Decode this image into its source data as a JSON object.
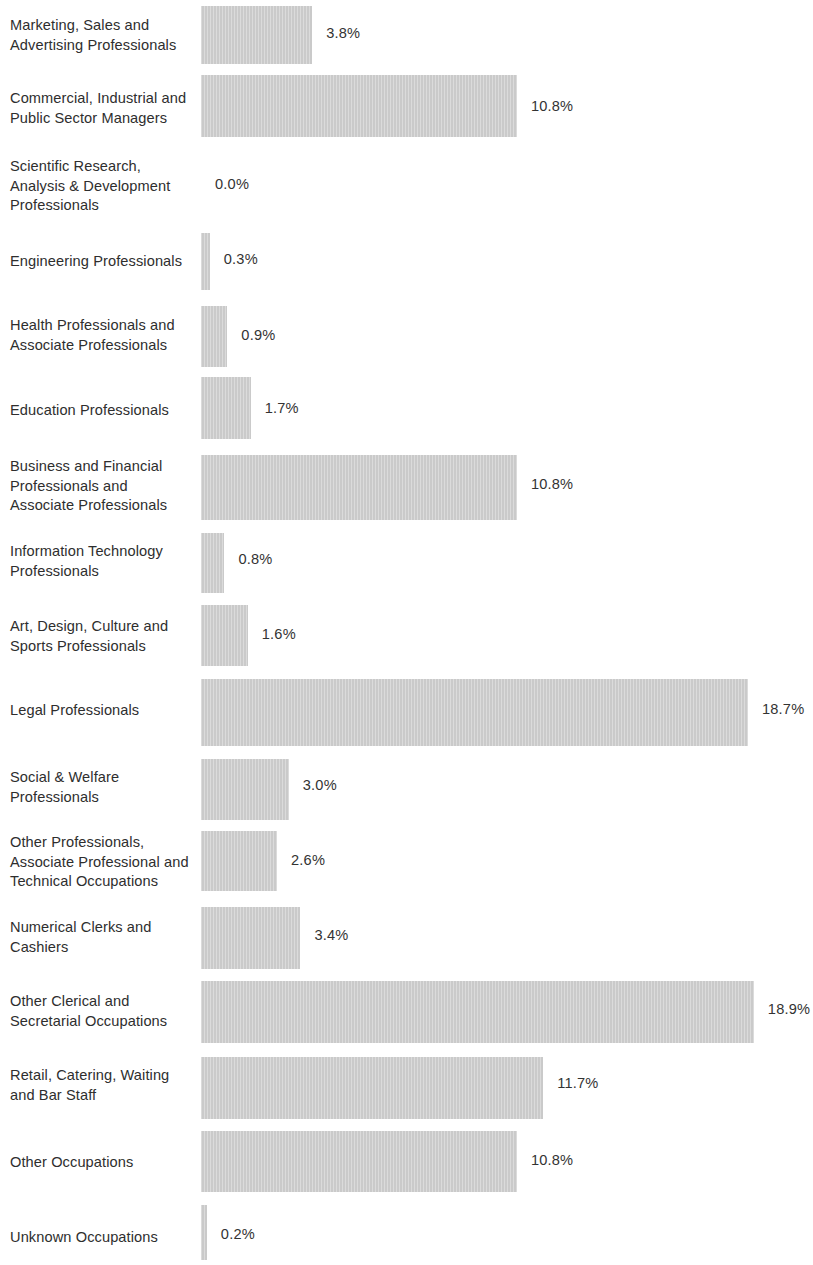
{
  "chart_data": {
    "type": "bar",
    "orientation": "horizontal",
    "title": "",
    "subtitle": "",
    "xlabel": "",
    "ylabel": "",
    "xlim": [
      0,
      20
    ],
    "grid": false,
    "legend": false,
    "value_suffix": "%",
    "bar_color": "#cccccc",
    "text_color": "#2e2e2e",
    "background_color": "#ffffff",
    "categories": [
      "Marketing, Sales and\nAdvertising Professionals",
      "Commercial, Industrial and\nPublic Sector Managers",
      "Scientific Research,\nAnalysis & Development\nProfessionals",
      "Engineering Professionals",
      "Health Professionals and\nAssociate Professionals",
      "Education Professionals",
      "Business and Financial\nProfessionals and\nAssociate Professionals",
      "Information Technology\nProfessionals",
      "Art, Design, Culture and\nSports Professionals",
      "Legal Professionals",
      "Social & Welfare\nProfessionals",
      "Other Professionals,\nAssociate Professional and\nTechnical Occupations",
      "Numerical Clerks and\nCashiers",
      "Other Clerical and\nSecretarial Occupations",
      "Retail, Catering, Waiting\nand Bar Staff",
      "Other Occupations",
      "Unknown Occupations"
    ],
    "values": [
      3.8,
      10.8,
      0.0,
      0.3,
      0.9,
      1.7,
      10.8,
      0.8,
      1.6,
      18.7,
      3.0,
      2.6,
      3.4,
      18.9,
      11.7,
      10.8,
      0.2
    ],
    "value_labels": [
      "3.8%",
      "10.8%",
      "0.0%",
      "0.3%",
      "0.9%",
      "1.7%",
      "10.8%",
      "0.8%",
      "1.6%",
      "18.7%",
      "3.0%",
      "2.6%",
      "3.4%",
      "18.9%",
      "11.7%",
      "10.8%",
      "0.2%"
    ]
  },
  "layout": {
    "bar_origin_x": 201,
    "px_per_percent": 29.25,
    "zero_label_x": 215,
    "value_label_gap": 14,
    "rows": [
      {
        "top": 0,
        "height": 70,
        "bar_top": 6,
        "bar_height": 58,
        "label_top": 16,
        "value_top": 25
      },
      {
        "top": 70,
        "height": 78,
        "bar_top": 75,
        "bar_height": 62,
        "label_top": 89,
        "value_top": 98
      },
      {
        "top": 150,
        "height": 82,
        "bar_top": 0,
        "bar_height": 0,
        "label_top": 157,
        "value_top": 176
      },
      {
        "top": 232,
        "height": 72,
        "bar_top": 233,
        "bar_height": 57,
        "label_top": 252,
        "value_top": 251
      },
      {
        "top": 304,
        "height": 70,
        "bar_top": 306,
        "bar_height": 61,
        "label_top": 316,
        "value_top": 327
      },
      {
        "top": 374,
        "height": 70,
        "bar_top": 377,
        "bar_height": 62,
        "label_top": 401,
        "value_top": 400
      },
      {
        "top": 444,
        "height": 88,
        "bar_top": 455,
        "bar_height": 65,
        "label_top": 457,
        "value_top": 476
      },
      {
        "top": 532,
        "height": 70,
        "bar_top": 533,
        "bar_height": 60,
        "label_top": 542,
        "value_top": 551
      },
      {
        "top": 602,
        "height": 74,
        "bar_top": 605,
        "bar_height": 61,
        "label_top": 617,
        "value_top": 626
      },
      {
        "top": 676,
        "height": 82,
        "bar_top": 679,
        "bar_height": 67,
        "label_top": 701,
        "value_top": 701
      },
      {
        "top": 758,
        "height": 72,
        "bar_top": 759,
        "bar_height": 61,
        "label_top": 768,
        "value_top": 777
      },
      {
        "top": 830,
        "height": 76,
        "bar_top": 831,
        "bar_height": 60,
        "label_top": 833,
        "value_top": 852
      },
      {
        "top": 906,
        "height": 74,
        "bar_top": 907,
        "bar_height": 62,
        "label_top": 918,
        "value_top": 927
      },
      {
        "top": 980,
        "height": 76,
        "bar_top": 981,
        "bar_height": 62,
        "label_top": 992,
        "value_top": 1001
      },
      {
        "top": 1056,
        "height": 74,
        "bar_top": 1057,
        "bar_height": 62,
        "label_top": 1066,
        "value_top": 1075
      },
      {
        "top": 1130,
        "height": 74,
        "bar_top": 1131,
        "bar_height": 61,
        "label_top": 1153,
        "value_top": 1152
      },
      {
        "top": 1204,
        "height": 61,
        "bar_top": 1205,
        "bar_height": 55,
        "label_top": 1228,
        "value_top": 1226
      }
    ]
  }
}
